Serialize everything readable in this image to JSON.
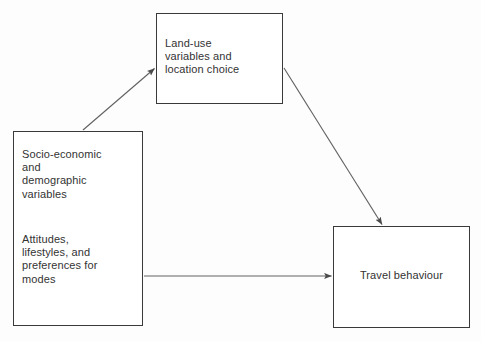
{
  "diagram": {
    "background_color": "#fdfdfd",
    "line_color": "#555555",
    "box_border_color": "#3a3a3a",
    "text_color": "#333333",
    "nodes": [
      {
        "id": "land_use",
        "label": "Land-use\nvariables and\nlocation choice",
        "x": 156,
        "y": 13,
        "width": 127,
        "height": 91
      },
      {
        "id": "socio_economic",
        "label_block_1": "Socio-economic\nand\ndemographic\nvariables",
        "label_block_2": "Attitudes,\nlifestyles, and\npreferences for\nmodes",
        "x": 13,
        "y": 131,
        "width": 130,
        "height": 195
      },
      {
        "id": "travel_behaviour",
        "label": "Travel behaviour",
        "x": 333,
        "y": 226,
        "width": 137,
        "height": 102
      }
    ],
    "arrows": [
      {
        "id": "socio-to-landuse",
        "from": "socio_economic",
        "to": "land_use",
        "direction": "up-right"
      },
      {
        "id": "landuse-to-travel",
        "from": "land_use",
        "to": "travel_behaviour",
        "direction": "down-right"
      },
      {
        "id": "socio-to-travel",
        "from": "socio_economic",
        "to": "travel_behaviour",
        "direction": "right"
      }
    ]
  }
}
